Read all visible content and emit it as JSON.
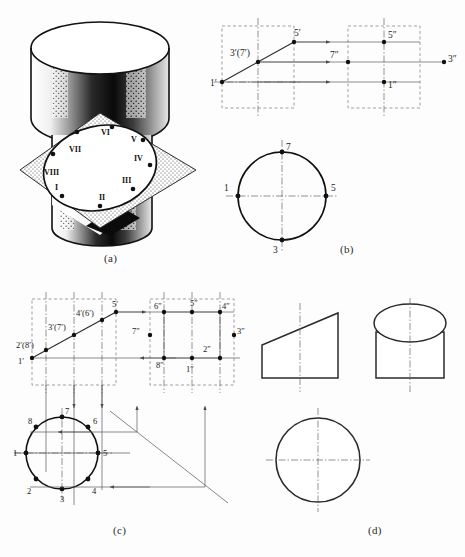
{
  "plate": {
    "title": "Cylinder truncated by an inclined plane — orthographic projection plate",
    "background_color": "#fdfdfd",
    "line_color": "#2b2b2b",
    "thin_line_color": "#5a5a5a"
  },
  "captions": [
    {
      "key": "a",
      "text": "(a)"
    },
    {
      "key": "b",
      "text": "(b)"
    },
    {
      "key": "c",
      "text": "(c)"
    },
    {
      "key": "d",
      "text": "(d)"
    }
  ],
  "panel_a": {
    "caption": "(a)",
    "description": "Pictorial of a cylinder cut by an inclined square cutting plane; the section outline is an ellipse with eight numbered points.",
    "roman_points": [
      {
        "numeral": "I",
        "x": 57,
        "y": 187
      },
      {
        "numeral": "II",
        "x": 103,
        "y": 195
      },
      {
        "numeral": "III",
        "x": 126,
        "y": 181
      },
      {
        "numeral": "IV",
        "x": 136,
        "y": 158
      },
      {
        "numeral": "V",
        "x": 135,
        "y": 140
      },
      {
        "numeral": "VI",
        "x": 104,
        "y": 135
      },
      {
        "numeral": "VII",
        "x": 73,
        "y": 147
      },
      {
        "numeral": "VIII",
        "x": 50,
        "y": 172
      }
    ]
  },
  "panel_b": {
    "caption": "(b)",
    "front_view_labels": [
      {
        "text": "1′",
        "x": 213,
        "y": 84
      },
      {
        "text": "3′(7′)",
        "x": 234,
        "y": 53
      },
      {
        "text": "5′",
        "x": 295,
        "y": 35
      }
    ],
    "side_view_labels": [
      {
        "text": "5″",
        "x": 388,
        "y": 37
      },
      {
        "text": "7″",
        "x": 330,
        "y": 60
      },
      {
        "text": "3″",
        "x": 440,
        "y": 63
      },
      {
        "text": "1″",
        "x": 388,
        "y": 88
      }
    ],
    "top_view_labels": [
      {
        "text": "7",
        "x": 291,
        "y": 146
      },
      {
        "text": "5",
        "x": 329,
        "y": 184
      },
      {
        "text": "3",
        "x": 272,
        "y": 247
      },
      {
        "text": "1",
        "x": 228,
        "y": 184
      }
    ]
  },
  "panel_c": {
    "caption": "(c)",
    "front_view_labels": [
      {
        "text": "1′",
        "x": 20,
        "y": 352
      },
      {
        "text": "2′(8′)",
        "x": 24,
        "y": 334
      },
      {
        "text": "3′(7′)",
        "x": 52,
        "y": 320
      },
      {
        "text": "4′(6′)",
        "x": 80,
        "y": 311
      },
      {
        "text": "5′",
        "x": 111,
        "y": 303
      }
    ],
    "side_view_labels": [
      {
        "text": "6″",
        "x": 150,
        "y": 311
      },
      {
        "text": "5″",
        "x": 186,
        "y": 307
      },
      {
        "text": "4″",
        "x": 219,
        "y": 311
      },
      {
        "text": "7″",
        "x": 132,
        "y": 333
      },
      {
        "text": "3″",
        "x": 236,
        "y": 333
      },
      {
        "text": "2″",
        "x": 205,
        "y": 340
      },
      {
        "text": "8″",
        "x": 156,
        "y": 352
      },
      {
        "text": "1″",
        "x": 185,
        "y": 357
      }
    ],
    "top_view_labels": [
      {
        "text": "8",
        "x": 33,
        "y": 423
      },
      {
        "text": "7",
        "x": 69,
        "y": 415
      },
      {
        "text": "6",
        "x": 100,
        "y": 423
      },
      {
        "text": "1",
        "x": 16,
        "y": 455
      },
      {
        "text": "5",
        "x": 108,
        "y": 455
      },
      {
        "text": "2",
        "x": 33,
        "y": 493
      },
      {
        "text": "3",
        "x": 69,
        "y": 500
      },
      {
        "text": "4",
        "x": 100,
        "y": 493
      }
    ]
  },
  "panel_d": {
    "caption": "(d)",
    "views": [
      {
        "name": "front-view",
        "shape": "truncated-trapezoid"
      },
      {
        "name": "side-view",
        "shape": "cylinder-with-ellipse-top"
      },
      {
        "name": "top-view",
        "shape": "circle"
      }
    ]
  }
}
